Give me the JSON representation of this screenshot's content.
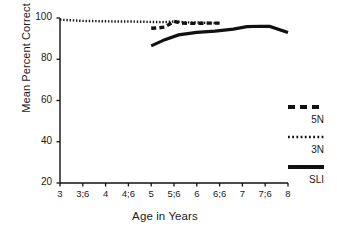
{
  "chart_data": {
    "type": "line",
    "title": "",
    "xlabel": "Age in Years",
    "ylabel": "Mean Percent Correct",
    "xtick_labels": [
      "3",
      "3;6",
      "4",
      "4;6",
      "5",
      "5;6",
      "6",
      "6;6",
      "7",
      "7;6",
      "8"
    ],
    "xtick_values": [
      3,
      3.5,
      4,
      4.5,
      5,
      5.5,
      6,
      6.5,
      7,
      7.5,
      8
    ],
    "ytick_labels": [
      "20",
      "40",
      "60",
      "80",
      "100"
    ],
    "ytick_values": [
      20,
      40,
      60,
      80,
      100
    ],
    "xlim": [
      3,
      8
    ],
    "ylim": [
      20,
      100
    ],
    "grid": false,
    "legend_position": "right",
    "series": [
      {
        "name": "3N",
        "style": "dotted",
        "color": "#111111",
        "x": [
          3.0,
          3.25,
          3.5,
          3.75,
          4.0,
          4.25,
          4.5,
          4.75,
          5.0,
          5.25,
          5.5,
          5.75,
          6.0,
          6.25,
          6.5
        ],
        "values": [
          99.2,
          98.9,
          98.6,
          98.5,
          98.4,
          98.3,
          98.3,
          98.2,
          98.1,
          98.0,
          98.3,
          97.9,
          97.8,
          97.6,
          97.5
        ]
      },
      {
        "name": "5N",
        "style": "dashed",
        "color": "#111111",
        "x": [
          5.0,
          5.15,
          5.3,
          5.5,
          5.65,
          5.8,
          6.0,
          6.2,
          6.4,
          6.5
        ],
        "values": [
          95.0,
          95.2,
          95.6,
          98.4,
          97.6,
          97.4,
          97.4,
          97.5,
          97.5,
          97.5
        ]
      },
      {
        "name": "SLI",
        "style": "solid",
        "color": "#111111",
        "x": [
          5.0,
          5.3,
          5.6,
          6.0,
          6.4,
          6.8,
          7.1,
          7.4,
          7.6,
          8.0
        ],
        "values": [
          86.5,
          89.5,
          91.8,
          93.0,
          93.6,
          94.6,
          95.8,
          96.0,
          95.9,
          93.0
        ]
      }
    ]
  },
  "legend": {
    "entries": [
      {
        "label": "5N",
        "style": "dashed"
      },
      {
        "label": "3N",
        "style": "dotted"
      },
      {
        "label": "SLI",
        "style": "solid"
      }
    ]
  }
}
